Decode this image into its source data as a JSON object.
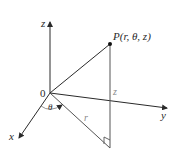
{
  "diagram": {
    "labels": {
      "origin": "0",
      "z_axis": "z",
      "y_axis": "y",
      "x_axis": "x",
      "point": "P(r, θ, z)",
      "height": "z",
      "radius": "r",
      "angle": "θ"
    },
    "colors": {
      "line": "#2a2a2a",
      "light_line": "#8a8a8a",
      "background": "#ffffff"
    }
  }
}
